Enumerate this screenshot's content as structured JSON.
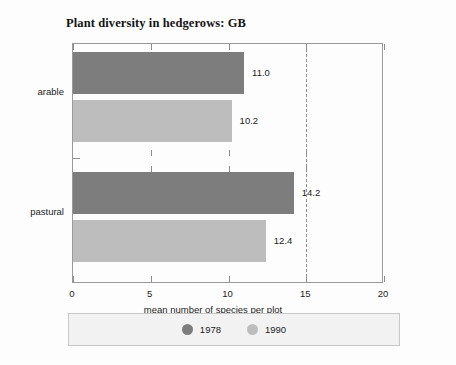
{
  "chart_data": {
    "type": "bar",
    "orientation": "horizontal",
    "title": "Plant diversity in hedgerows: GB",
    "xlabel": "mean number of species per plot",
    "ylabel": "",
    "xlim": [
      0,
      20
    ],
    "xticks": [
      0,
      5,
      10,
      15,
      20
    ],
    "xtick_labels": [
      "0",
      "5",
      "10",
      "15",
      "20"
    ],
    "grid": false,
    "legend_position": "bottom",
    "categories": [
      "arable",
      "pastural"
    ],
    "series": [
      {
        "name": "1978",
        "color": "#7d7d7d",
        "values": [
          11.0,
          14.2
        ],
        "value_labels": [
          "11.0",
          "14.2"
        ]
      },
      {
        "name": "1990",
        "color": "#bdbdbd",
        "values": [
          10.2,
          12.4
        ],
        "value_labels": [
          "10.2",
          "12.4"
        ]
      }
    ],
    "annotations": [
      {
        "kind": "reference-line",
        "axis": "x",
        "value": 15,
        "style": "dashed",
        "color": "#8e8e8e"
      }
    ]
  },
  "legend": {
    "entries": [
      {
        "label": "1978",
        "swatch": "circle-dark-gray"
      },
      {
        "label": "1990",
        "swatch": "circle-light-gray"
      }
    ]
  },
  "colors": {
    "series_1978": "#7d7d7d",
    "series_1990": "#bdbdbd",
    "frame": "#9a9a9a",
    "text": "#1c1c1c",
    "legend_background": "#f2f2f2"
  }
}
